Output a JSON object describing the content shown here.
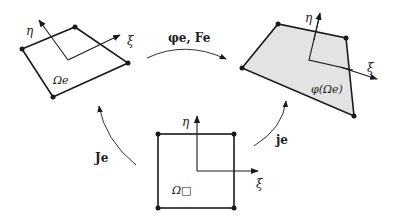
{
  "diagram": {
    "elements": {
      "physical_element": {
        "label": "Ωe",
        "axis_eta": "η",
        "axis_xi": "ξ"
      },
      "deformed_element": {
        "label": "φ(Ωe)",
        "axis_eta": "η",
        "axis_xi": "ξ",
        "fill": "#e3e3e3"
      },
      "reference_element": {
        "label": "Ω□",
        "axis_eta": "η",
        "axis_xi": "ξ"
      }
    },
    "mappings": {
      "top": "φe, Fe",
      "left": "Je",
      "right": "je"
    },
    "colors": {
      "stroke": "#1a1a1a",
      "fill": "#e3e3e3",
      "arrow": "#333333"
    }
  }
}
